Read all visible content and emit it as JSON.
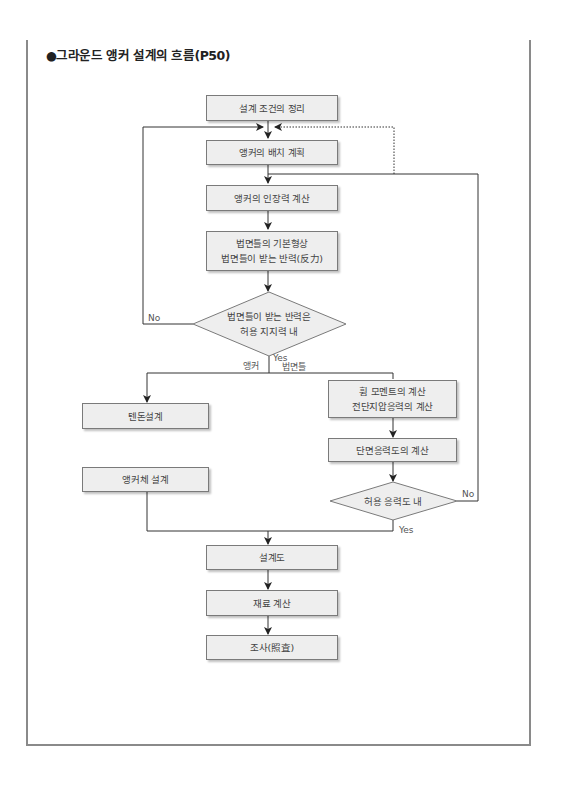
{
  "title": "●그라운드 앵커 설계의 흐름(P50)",
  "nodes": {
    "design_conditions": "설계 조건의 정리",
    "anchor_layout": "앵커의 배치 계획",
    "anchor_tension": "앵커의 인장력 계산",
    "slope_shape_line1": "법면틀의 기본형상",
    "slope_shape_line2": "법면틀이 받는 반력(反力)",
    "decision1_line1": "법면틀이 받는 반력은",
    "decision1_line2": "허용 지지력 내",
    "tendon_design": "텐돈설계",
    "anchor_body_design": "앵커체 설계",
    "moment_line1": "휨 모멘트의 계산",
    "moment_line2": "전단지압응력의 계산",
    "section_stress": "단면응력도의 계산",
    "decision2": "허용 응력도 내",
    "drawing": "설계도",
    "material_calc": "재료 계산",
    "review": "조사(照査)"
  },
  "labels": {
    "no_left": "No",
    "yes_center": "Yes",
    "branch_anchor": "앵커",
    "branch_slope": "법면틀",
    "no_right": "No",
    "yes_right": "Yes"
  },
  "colors": {
    "box_fill": "#eeeeee",
    "box_border": "#7a7a7a",
    "line": "#333333",
    "frame": "#8a8a8a"
  }
}
